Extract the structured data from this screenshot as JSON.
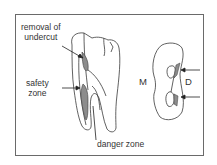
{
  "figure": {
    "labels": {
      "removal_line1": "removal of",
      "removal_line2": "undercut",
      "safety_line1": "safety",
      "safety_line2": "zone",
      "danger": "danger zone",
      "mesial": "M",
      "distal": "D"
    },
    "colors": {
      "outline": "#3a3a3a",
      "shaded": "#8c8c8c",
      "frame": "#6a6a6a",
      "text": "#333333"
    },
    "panels": [
      {
        "name": "tooth-longitudinal-view",
        "description": "Mandibular molar with mesial root canal, showing removal of undercut, safety zone and danger zone"
      },
      {
        "name": "root-cross-section",
        "description": "Cross-section of mesial root with two canals, mesial (M) and distal (D) sides"
      }
    ]
  }
}
